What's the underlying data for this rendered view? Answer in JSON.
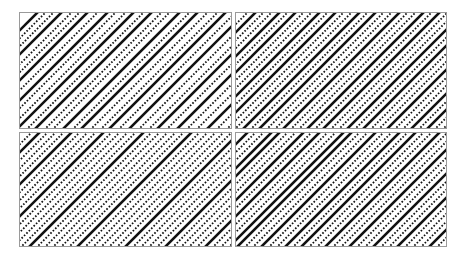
{
  "figure": {
    "panels": [
      {
        "id": "top-left",
        "lines": [
          [
            -100,
            "s"
          ],
          [
            -92,
            "d"
          ],
          [
            -84,
            "d"
          ],
          [
            -76,
            "s"
          ],
          [
            -66,
            "d"
          ],
          [
            -58,
            "d"
          ],
          [
            -50,
            "s"
          ],
          [
            -40,
            "d"
          ],
          [
            -30,
            "s"
          ],
          [
            -22,
            "d"
          ],
          [
            -12,
            "d"
          ],
          [
            -4,
            "s"
          ],
          [
            6,
            "d"
          ],
          [
            14,
            "s"
          ],
          [
            24,
            "d"
          ],
          [
            32,
            "d"
          ],
          [
            42,
            "s"
          ],
          [
            52,
            "d"
          ],
          [
            60,
            "s"
          ],
          [
            70,
            "d"
          ],
          [
            80,
            "d"
          ],
          [
            88,
            "s"
          ],
          [
            98,
            "d"
          ],
          [
            108,
            "s"
          ],
          [
            118,
            "d"
          ],
          [
            128,
            "d"
          ],
          [
            136,
            "s"
          ],
          [
            146,
            "d"
          ],
          [
            156,
            "s"
          ],
          [
            166,
            "d"
          ],
          [
            176,
            "d"
          ],
          [
            186,
            "s"
          ],
          [
            196,
            "d"
          ],
          [
            206,
            "d"
          ],
          [
            214,
            "s"
          ],
          [
            224,
            "d"
          ],
          [
            234,
            "s"
          ],
          [
            244,
            "d"
          ],
          [
            254,
            "d"
          ],
          [
            264,
            "s"
          ],
          [
            274,
            "d"
          ],
          [
            284,
            "d"
          ],
          [
            294,
            "s"
          ],
          [
            304,
            "d"
          ],
          [
            314,
            "d"
          ]
        ]
      },
      {
        "id": "top-right",
        "lines": [
          [
            -106,
            "d"
          ],
          [
            -98,
            "s"
          ],
          [
            -90,
            "d"
          ],
          [
            -82,
            "d"
          ],
          [
            -74,
            "s"
          ],
          [
            -66,
            "d"
          ],
          [
            -58,
            "s"
          ],
          [
            -50,
            "d"
          ],
          [
            -42,
            "d"
          ],
          [
            -34,
            "s"
          ],
          [
            -26,
            "d"
          ],
          [
            -18,
            "s"
          ],
          [
            -10,
            "d"
          ],
          [
            -2,
            "d"
          ],
          [
            6,
            "s"
          ],
          [
            14,
            "d"
          ],
          [
            22,
            "s"
          ],
          [
            30,
            "d"
          ],
          [
            38,
            "d"
          ],
          [
            46,
            "s"
          ],
          [
            54,
            "d"
          ],
          [
            62,
            "d"
          ],
          [
            70,
            "s"
          ],
          [
            78,
            "d"
          ],
          [
            86,
            "s"
          ],
          [
            94,
            "d"
          ],
          [
            102,
            "d"
          ],
          [
            110,
            "s"
          ],
          [
            118,
            "d"
          ],
          [
            126,
            "s"
          ],
          [
            134,
            "d"
          ],
          [
            142,
            "d"
          ],
          [
            150,
            "s"
          ],
          [
            158,
            "d"
          ],
          [
            166,
            "d"
          ],
          [
            174,
            "s"
          ],
          [
            182,
            "d"
          ],
          [
            190,
            "s"
          ],
          [
            198,
            "d"
          ],
          [
            206,
            "d"
          ],
          [
            214,
            "s"
          ],
          [
            222,
            "d"
          ],
          [
            230,
            "s"
          ],
          [
            240,
            "d"
          ],
          [
            250,
            "d"
          ],
          [
            260,
            "s"
          ],
          [
            270,
            "d"
          ],
          [
            280,
            "d"
          ],
          [
            290,
            "s"
          ],
          [
            300,
            "d"
          ],
          [
            310,
            "d"
          ]
        ]
      },
      {
        "id": "bottom-left",
        "lines": [
          [
            -104,
            "d"
          ],
          [
            -96,
            "s"
          ],
          [
            -88,
            "d"
          ],
          [
            -80,
            "d"
          ],
          [
            -72,
            "d"
          ],
          [
            -64,
            "s"
          ],
          [
            -56,
            "d"
          ],
          [
            -48,
            "d"
          ],
          [
            -40,
            "d"
          ],
          [
            -32,
            "s"
          ],
          [
            -24,
            "d"
          ],
          [
            -16,
            "d"
          ],
          [
            -8,
            "d"
          ],
          [
            0,
            "d"
          ],
          [
            8,
            "s"
          ],
          [
            16,
            "d"
          ],
          [
            24,
            "d"
          ],
          [
            32,
            "d"
          ],
          [
            40,
            "d"
          ],
          [
            48,
            "d"
          ],
          [
            56,
            "s"
          ],
          [
            64,
            "d"
          ],
          [
            72,
            "d"
          ],
          [
            80,
            "d"
          ],
          [
            88,
            "d"
          ],
          [
            96,
            "d"
          ],
          [
            104,
            "s"
          ],
          [
            112,
            "d"
          ],
          [
            120,
            "d"
          ],
          [
            128,
            "d"
          ],
          [
            136,
            "d"
          ],
          [
            144,
            "s"
          ],
          [
            152,
            "d"
          ],
          [
            160,
            "d"
          ],
          [
            168,
            "d"
          ],
          [
            176,
            "d"
          ],
          [
            184,
            "s"
          ],
          [
            192,
            "d"
          ],
          [
            200,
            "d"
          ],
          [
            208,
            "d"
          ],
          [
            216,
            "s"
          ],
          [
            224,
            "d"
          ],
          [
            232,
            "d"
          ],
          [
            240,
            "d"
          ],
          [
            248,
            "s"
          ],
          [
            256,
            "d"
          ],
          [
            264,
            "d"
          ],
          [
            272,
            "d"
          ],
          [
            280,
            "s"
          ],
          [
            288,
            "d"
          ],
          [
            296,
            "d"
          ],
          [
            304,
            "d"
          ],
          [
            312,
            "d"
          ]
        ]
      },
      {
        "id": "bottom-right",
        "lines": [
          [
            -104,
            "s"
          ],
          [
            -96,
            "d"
          ],
          [
            -88,
            "d"
          ],
          [
            -80,
            "s"
          ],
          [
            -72,
            "s"
          ],
          [
            -64,
            "d"
          ],
          [
            -56,
            "d"
          ],
          [
            -48,
            "s"
          ],
          [
            -40,
            "d"
          ],
          [
            -32,
            "s"
          ],
          [
            -24,
            "d"
          ],
          [
            -16,
            "d"
          ],
          [
            -8,
            "s"
          ],
          [
            0,
            "s"
          ],
          [
            8,
            "d"
          ],
          [
            16,
            "d"
          ],
          [
            24,
            "s"
          ],
          [
            32,
            "d"
          ],
          [
            40,
            "d"
          ],
          [
            48,
            "s"
          ],
          [
            56,
            "d"
          ],
          [
            64,
            "s"
          ],
          [
            72,
            "d"
          ],
          [
            80,
            "d"
          ],
          [
            88,
            "s"
          ],
          [
            96,
            "d"
          ],
          [
            104,
            "d"
          ],
          [
            112,
            "s"
          ],
          [
            120,
            "d"
          ],
          [
            128,
            "d"
          ],
          [
            136,
            "s"
          ],
          [
            144,
            "d"
          ],
          [
            152,
            "d"
          ],
          [
            160,
            "s"
          ],
          [
            168,
            "d"
          ],
          [
            176,
            "d"
          ],
          [
            184,
            "d"
          ],
          [
            192,
            "s"
          ],
          [
            200,
            "d"
          ],
          [
            208,
            "d"
          ],
          [
            216,
            "d"
          ],
          [
            224,
            "s"
          ],
          [
            232,
            "d"
          ],
          [
            240,
            "d"
          ],
          [
            248,
            "d"
          ],
          [
            256,
            "d"
          ],
          [
            264,
            "s"
          ],
          [
            272,
            "d"
          ],
          [
            280,
            "d"
          ],
          [
            288,
            "d"
          ],
          [
            296,
            "d"
          ],
          [
            304,
            "d"
          ],
          [
            312,
            "d"
          ]
        ]
      }
    ],
    "colors": {
      "ink": "#111111",
      "border": "#9a9a9a",
      "background": "#ffffff"
    }
  }
}
